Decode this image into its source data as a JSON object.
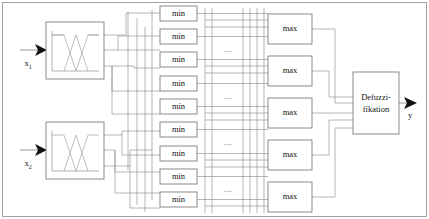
{
  "diagram": {
    "background_color": "#ffffff",
    "line_color": "#8f8f8f",
    "box_fill": "#ffffff",
    "box_stroke": "#6e6e6e",
    "text_color": "#111111"
  },
  "inputs": [
    {
      "label": "x",
      "subscript": "1",
      "name": "input-x1"
    },
    {
      "label": "x",
      "subscript": "2",
      "name": "input-x2"
    }
  ],
  "output": {
    "label": "y",
    "name": "output-y"
  },
  "fuzzification_blocks": [
    {
      "name": "fuzzification-block-x1",
      "content": "membership-functions-plot"
    },
    {
      "name": "fuzzification-block-x2",
      "content": "membership-functions-plot"
    }
  ],
  "min_blocks": [
    {
      "label": "min"
    },
    {
      "label": "min"
    },
    {
      "label": "min"
    },
    {
      "label": "min"
    },
    {
      "label": "min"
    },
    {
      "label": "min"
    },
    {
      "label": "min"
    },
    {
      "label": "min"
    },
    {
      "label": "min"
    }
  ],
  "max_blocks": [
    {
      "label": "max"
    },
    {
      "label": "max"
    },
    {
      "label": "max"
    },
    {
      "label": "max"
    },
    {
      "label": "max"
    }
  ],
  "ellipses": [
    {
      "label": "..."
    },
    {
      "label": "..."
    },
    {
      "label": "..."
    },
    {
      "label": "..."
    }
  ],
  "defuzzification_block": {
    "line1": "Defuzzi-",
    "line2": "fikation",
    "name": "defuzzification-block"
  }
}
